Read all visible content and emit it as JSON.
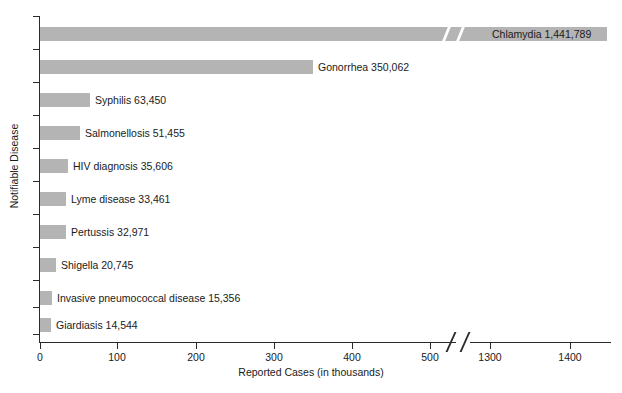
{
  "chart_data": {
    "type": "bar",
    "orientation": "horizontal",
    "title": "",
    "xlabel": "Reported Cases (in thousands)",
    "ylabel": "Notifiable Disease",
    "xlim": [
      0,
      1450
    ],
    "grid": false,
    "legend": null,
    "axis_break": {
      "present": true,
      "between": [
        540,
        1250
      ],
      "note": "x-axis broken between 500 and 1300 tick labels"
    },
    "xticks": [
      {
        "value": 0,
        "label": "0",
        "px": 40
      },
      {
        "value": 100,
        "label": "100",
        "px": 117
      },
      {
        "value": 200,
        "label": "200",
        "px": 196
      },
      {
        "value": 300,
        "label": "300",
        "px": 274
      },
      {
        "value": 400,
        "label": "400",
        "px": 352
      },
      {
        "value": 500,
        "label": "500",
        "px": 430
      },
      {
        "value": 1300,
        "label": "1300",
        "px": 490
      },
      {
        "value": 1400,
        "label": "1400",
        "px": 570
      }
    ],
    "categories": [
      "Chlamydia",
      "Gonorrhea",
      "Syphilis",
      "Salmonellosis",
      "HIV diagnosis",
      "Lyme disease",
      "Pertussis",
      "Shigella",
      "Invasive pneumococcal disease",
      "Giardiasis"
    ],
    "values": [
      1441789,
      350062,
      63450,
      51455,
      35606,
      33461,
      32971,
      20745,
      15356,
      14544
    ],
    "value_labels": [
      "1,441,789",
      "350,062",
      "63,450",
      "51,455",
      "35,606",
      "33,461",
      "32,971",
      "20,745",
      "15,356",
      "14,544"
    ],
    "bars": [
      {
        "label": "Chlamydia 1,441,789",
        "value": 1441789,
        "top": 27,
        "left": 40,
        "width": 567,
        "broken": true,
        "label_inside": true,
        "label_left": 492
      },
      {
        "label": "Gonorrhea 350,062",
        "value": 350062,
        "top": 60,
        "left": 40,
        "width": 273,
        "broken": false,
        "label_inside": false,
        "label_left": 318
      },
      {
        "label": "Syphilis 63,450",
        "value": 63450,
        "top": 93,
        "left": 40,
        "width": 50,
        "broken": false,
        "label_inside": false,
        "label_left": 95
      },
      {
        "label": "Salmonellosis 51,455",
        "value": 51455,
        "top": 126,
        "left": 40,
        "width": 40,
        "broken": false,
        "label_inside": false,
        "label_left": 85
      },
      {
        "label": "HIV diagnosis 35,606",
        "value": 35606,
        "top": 159,
        "left": 40,
        "width": 28,
        "broken": false,
        "label_inside": false,
        "label_left": 73
      },
      {
        "label": "Lyme disease 33,461",
        "value": 33461,
        "top": 192,
        "left": 40,
        "width": 26,
        "broken": false,
        "label_inside": false,
        "label_left": 71
      },
      {
        "label": "Pertussis 32,971",
        "value": 32971,
        "top": 225,
        "left": 40,
        "width": 26,
        "broken": false,
        "label_inside": false,
        "label_left": 71
      },
      {
        "label": "Shigella 20,745",
        "value": 20745,
        "top": 258,
        "left": 40,
        "width": 16,
        "broken": false,
        "label_inside": false,
        "label_left": 61
      },
      {
        "label": "Invasive pneumococcal disease 15,356",
        "value": 15356,
        "top": 291,
        "left": 40,
        "width": 12,
        "broken": false,
        "label_inside": false,
        "label_left": 57
      },
      {
        "label": "Giardiasis 14,544",
        "value": 14544,
        "top": 318,
        "left": 40,
        "width": 11,
        "broken": false,
        "label_inside": false,
        "label_left": 56
      }
    ],
    "yticks_px": [
      16,
      49,
      82,
      115,
      148,
      181,
      214,
      247,
      280,
      307,
      334
    ],
    "colors": {
      "bar": "#b4b4b4",
      "axis": "#2b2b2b",
      "text": "#1a1a1a",
      "background": "#ffffff"
    }
  }
}
